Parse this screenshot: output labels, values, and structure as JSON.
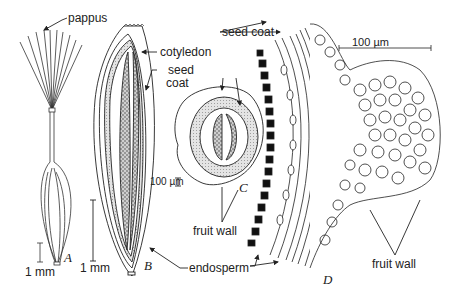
{
  "figure": {
    "panels": [
      {
        "id": "A",
        "label": "A",
        "scale_bar": "1 mm",
        "description": "whole fruit with pappus"
      },
      {
        "id": "B",
        "label": "B",
        "scale_bar": "1 mm",
        "description": "longitudinal section of fruit"
      },
      {
        "id": "C",
        "label": "C",
        "scale_bar": "100 µm",
        "description": "cross section of fruit"
      },
      {
        "id": "D",
        "label": "D",
        "scale_bar": "100 µm",
        "description": "detail of fruit wall and seed coat"
      }
    ],
    "labels": {
      "pappus": "pappus",
      "cotyledon": "cotyledon",
      "seed_coat_B_line1": "seed",
      "seed_coat_B_line2": "coat",
      "seed_coat_D": "seed coat",
      "fruit_wall_C": "fruit wall",
      "fruit_wall_D": "fruit wall",
      "endosperm": "endosperm"
    },
    "scale_bars": {
      "A": "1 mm",
      "B": "1 mm",
      "C": "100 µm",
      "D": "100 µm"
    }
  }
}
